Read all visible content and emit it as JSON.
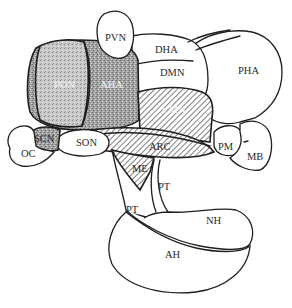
{
  "figure": {
    "type": "anatomical diagram",
    "colors": {
      "stroke": "#1e1e1e",
      "gray_fill": "#9a9a9a",
      "hatch_line": "#3a3a3a",
      "background": "#ffffff"
    }
  },
  "labels": {
    "pvn": "PVN",
    "dha": "DHA",
    "dmn": "DMN",
    "pha": "PHA",
    "pon": "PON",
    "aha": "AHA",
    "vmn": "VMN",
    "scn": "SCN",
    "son": "SON",
    "arc": "ARC",
    "pm": "PM",
    "mb": "MB",
    "oc": "OC",
    "me": "ME",
    "pt_upper": "PT",
    "pt_lower": "PT",
    "nh": "NH",
    "ah": "AH"
  },
  "regions": [
    {
      "id": "PVN",
      "fill": "white"
    },
    {
      "id": "DHA",
      "fill": "white"
    },
    {
      "id": "DMN",
      "fill": "white"
    },
    {
      "id": "PHA",
      "fill": "white"
    },
    {
      "id": "PON",
      "fill": "stippled-gray"
    },
    {
      "id": "AHA",
      "fill": "stippled-gray"
    },
    {
      "id": "SCN",
      "fill": "stippled-gray"
    },
    {
      "id": "VMN",
      "fill": "hatched"
    },
    {
      "id": "ARC",
      "fill": "hatched"
    },
    {
      "id": "ME",
      "fill": "hatched"
    },
    {
      "id": "SON",
      "fill": "white"
    },
    {
      "id": "PM",
      "fill": "white"
    },
    {
      "id": "MB",
      "fill": "white"
    },
    {
      "id": "OC",
      "fill": "white"
    },
    {
      "id": "PT",
      "fill": "white"
    },
    {
      "id": "NH",
      "fill": "white"
    },
    {
      "id": "AH",
      "fill": "white"
    }
  ]
}
